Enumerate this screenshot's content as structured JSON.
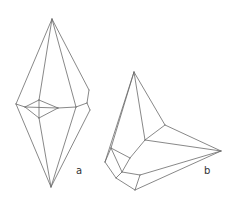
{
  "figure": {
    "panels": [
      {
        "id": "a",
        "label": "a",
        "description": "Bipyramidal crystal wireframe, vertical orientation",
        "edges": [
          [
            52,
            19,
            16,
            104
          ],
          [
            52,
            19,
            39,
            100
          ],
          [
            52,
            19,
            76,
            107
          ],
          [
            52,
            19,
            89,
            90
          ],
          [
            16,
            104,
            51,
            187
          ],
          [
            39,
            118,
            51,
            187
          ],
          [
            76,
            107,
            51,
            187
          ],
          [
            90,
            110,
            51,
            187
          ],
          [
            16,
            104,
            25,
            107
          ],
          [
            25,
            107,
            39,
            100
          ],
          [
            39,
            100,
            58,
            108
          ],
          [
            58,
            108,
            39,
            118
          ],
          [
            39,
            118,
            25,
            107
          ],
          [
            25,
            107,
            58,
            108
          ],
          [
            39,
            100,
            39,
            118
          ],
          [
            58,
            108,
            76,
            107
          ],
          [
            76,
            107,
            87,
            103
          ],
          [
            87,
            103,
            89,
            90
          ],
          [
            87,
            103,
            90,
            110
          ]
        ]
      },
      {
        "id": "b",
        "label": "b",
        "description": "Tilted crystal wireframe with apex and spreading base",
        "edges": [
          [
            134,
            72,
            105,
            162
          ],
          [
            134,
            72,
            111,
            148
          ],
          [
            134,
            72,
            145,
            140
          ],
          [
            134,
            72,
            165,
            125
          ],
          [
            165,
            125,
            145,
            140
          ],
          [
            165,
            125,
            221,
            151
          ],
          [
            145,
            140,
            221,
            151
          ],
          [
            145,
            140,
            130,
            158
          ],
          [
            105,
            162,
            111,
            148
          ],
          [
            111,
            148,
            130,
            158
          ],
          [
            130,
            158,
            122,
            172
          ],
          [
            122,
            172,
            116,
            178
          ],
          [
            105,
            162,
            116,
            178
          ],
          [
            122,
            172,
            140,
            175
          ],
          [
            140,
            175,
            221,
            151
          ],
          [
            116,
            178,
            135,
            190
          ],
          [
            135,
            190,
            221,
            151
          ],
          [
            140,
            175,
            135,
            190
          ],
          [
            111,
            148,
            122,
            172
          ]
        ]
      }
    ]
  },
  "colors": {
    "line": "#6a6a6a",
    "background": "#ffffff",
    "label": "#333333"
  }
}
